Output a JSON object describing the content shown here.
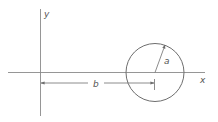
{
  "diagram": {
    "axes": {
      "x_label": "x",
      "y_label": "y"
    },
    "circle": {
      "radius_label": "a"
    },
    "distance": {
      "label": "b"
    },
    "colors": {
      "line": "#6e6e6e",
      "text": "#555555",
      "background": "#ffffff"
    }
  }
}
